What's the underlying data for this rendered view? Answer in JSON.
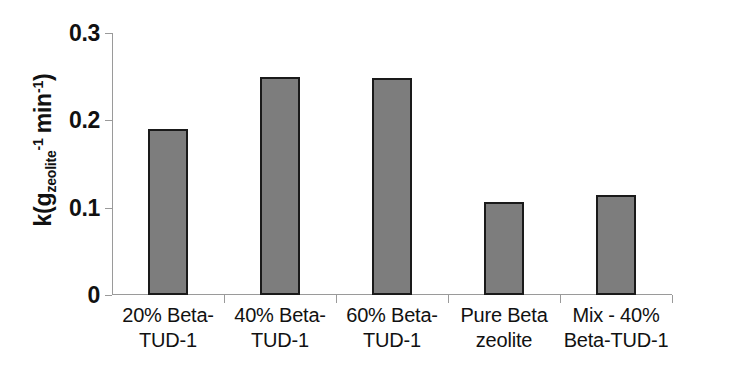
{
  "chart_data": {
    "type": "bar",
    "title": "",
    "xlabel": "",
    "ylabel": "k(g_zeolite^-1 min^-1)",
    "ylabel_parts": {
      "lead": "k(g",
      "sub1": "zeolite",
      "sup1": "-1",
      "mid": "min",
      "sup2": "-1",
      "tail": ")"
    },
    "categories": [
      "20% Beta-TUD-1",
      "40% Beta-TUD-1",
      "60% Beta-TUD-1",
      "Pure Beta zeolite",
      "Mix - 40% Beta-TUD-1"
    ],
    "category_lines": [
      [
        "20% Beta-",
        "TUD-1"
      ],
      [
        "40% Beta-",
        "TUD-1"
      ],
      [
        "60% Beta-",
        "TUD-1"
      ],
      [
        "Pure Beta",
        "zeolite"
      ],
      [
        "Mix - 40%",
        "Beta-TUD-1"
      ]
    ],
    "values": [
      0.19,
      0.25,
      0.249,
      0.107,
      0.115
    ],
    "ylim": [
      0,
      0.3
    ],
    "yticks": [
      0,
      0.1,
      0.2,
      0.3
    ],
    "ytick_labels": [
      "0",
      "0.1",
      "0.2",
      "0.3"
    ],
    "grid": false,
    "legend": null,
    "bar_fill_color": "#7d7d7d",
    "bar_edge_color": "#1a1a1a",
    "axis_color": "#9a9a9a",
    "background_color": "#ffffff"
  }
}
